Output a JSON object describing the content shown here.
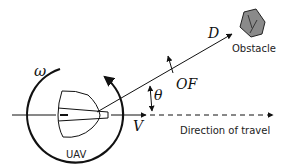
{
  "diagram": {
    "labels": {
      "omega": "ω",
      "theta": "θ",
      "optic_flow": "OF",
      "distance": "D",
      "velocity": "V",
      "obstacle": "Obstacle",
      "uav": "UAV",
      "direction": "Direction of travel"
    },
    "colors": {
      "stroke": "#111111",
      "obstacle_fill": "#8a8a8a",
      "background": "#ffffff"
    }
  }
}
